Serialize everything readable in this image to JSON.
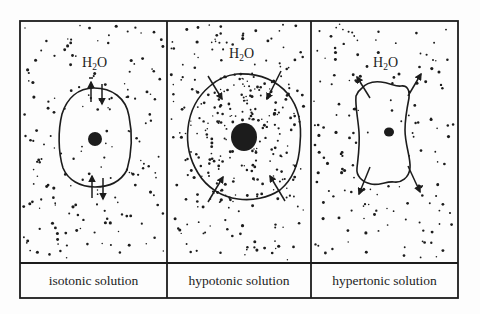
{
  "figure": {
    "frame": {
      "x": 20,
      "y": 21,
      "w": 438,
      "h": 277,
      "label_row_top": 263,
      "stroke": "#1c1c1c"
    },
    "colors": {
      "ink": "#1c1c1c",
      "background": "#fdfdfd"
    },
    "panels": [
      {
        "id": "isotonic",
        "label": "isotonic solution",
        "x0": 20,
        "x1": 167,
        "molecule": {
          "base": "H",
          "sub": "2",
          "tail": "O",
          "x": 82,
          "y": 67
        },
        "outside_dot_count": 150,
        "cell": {
          "path": "M94,88 C112,88 126,98 129,116 C133,136 131,156 127,170 C121,181 110,187 95,187 C80,187 68,180 63,168 C58,152 58,130 62,114 C67,98 78,88 94,88 Z",
          "inside_dot_count": 25,
          "nucleus": {
            "cx": 95,
            "cy": 139,
            "rx": 7,
            "ry": 7
          }
        },
        "arrows": [
          {
            "x1": 91,
            "y1": 102,
            "x2": 91,
            "y2": 82
          },
          {
            "x1": 102,
            "y1": 84,
            "x2": 102,
            "y2": 104
          },
          {
            "x1": 92,
            "y1": 198,
            "x2": 92,
            "y2": 176
          },
          {
            "x1": 103,
            "y1": 178,
            "x2": 103,
            "y2": 199
          }
        ],
        "minus_mark": {
          "x": 91,
          "y": 78
        },
        "seed": 11
      },
      {
        "id": "hypotonic",
        "label": "hypotonic solution",
        "x0": 167,
        "x1": 311,
        "molecule": {
          "base": "H",
          "sub": "2",
          "tail": "O",
          "x": 229,
          "y": 58
        },
        "outside_dot_count": 140,
        "cell": {
          "path": "M237,74 C258,73 276,80 288,94 C298,106 302,124 300,144 C299,164 292,180 280,190 C268,198 252,201 238,199 C222,197 207,188 198,173 C190,160 186,146 188,128 C190,110 198,96 210,86 C219,78 228,75 237,74 Z",
          "inside_dot_count": 180,
          "nucleus": {
            "cx": 244,
            "cy": 137,
            "rx": 13,
            "ry": 14
          }
        },
        "arrows": [
          {
            "x1": 208,
            "y1": 76,
            "x2": 222,
            "y2": 99
          },
          {
            "x1": 281,
            "y1": 71,
            "x2": 267,
            "y2": 99
          },
          {
            "x1": 208,
            "y1": 202,
            "x2": 223,
            "y2": 177
          },
          {
            "x1": 285,
            "y1": 201,
            "x2": 270,
            "y2": 176
          }
        ],
        "seed": 23
      },
      {
        "id": "hypertonic",
        "label": "hypertonic solution",
        "x0": 311,
        "x1": 458,
        "molecule": {
          "base": "H",
          "sub": "2",
          "tail": "O",
          "x": 373,
          "y": 67
        },
        "outside_dot_count": 150,
        "cell": {
          "path": "M361,89 C365,84 372,81 381,82 C390,83 396,87 401,86 C407,85 410,90 409,98 C407,108 405,118 405,130 C405,145 411,158 410,168 C409,178 401,183 394,182 C386,181 379,186 371,184 C362,182 356,176 357,168 C358,158 360,146 359,132 C358,118 355,106 356,96 C357,93 358,91 361,89 Z",
          "inside_dot_count": 5,
          "nucleus": {
            "cx": 389,
            "cy": 132,
            "rx": 5,
            "ry": 4.5
          }
        },
        "arrows": [
          {
            "x1": 370,
            "y1": 98,
            "x2": 357,
            "y2": 77
          },
          {
            "x1": 408,
            "y1": 96,
            "x2": 421,
            "y2": 74
          },
          {
            "x1": 370,
            "y1": 167,
            "x2": 359,
            "y2": 194
          },
          {
            "x1": 408,
            "y1": 166,
            "x2": 420,
            "y2": 192
          }
        ],
        "seed": 37
      }
    ]
  }
}
